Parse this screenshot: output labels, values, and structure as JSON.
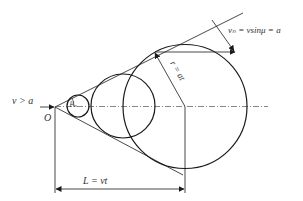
{
  "diagram": {
    "labels": {
      "velocity_condition": "v > a",
      "origin": "O",
      "mach_angle": "μ",
      "radius": "r = at",
      "normal_velocity": "vₙ = vsinμ = a",
      "distance": "L = vt"
    },
    "colors": {
      "stroke": "#1a1a1a",
      "text": "#333333",
      "background": "#ffffff"
    }
  }
}
